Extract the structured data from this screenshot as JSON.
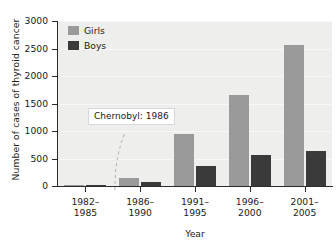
{
  "chart_data": {
    "type": "bar",
    "title": "",
    "xlabel": "Year",
    "ylabel": "Number of cases of thyroid cancer",
    "categories": [
      "1982–1985",
      "1986–1990",
      "1991–1995",
      "1996–2000",
      "2001–2005"
    ],
    "category_lines": [
      [
        "1982–",
        "1985"
      ],
      [
        "1986–",
        "1990"
      ],
      [
        "1991–",
        "1995"
      ],
      [
        "1996–",
        "2000"
      ],
      [
        "2001–",
        "2005"
      ]
    ],
    "series": [
      {
        "name": "Girls",
        "color": "#9a9a9a",
        "values": [
          10,
          150,
          950,
          1660,
          2570
        ]
      },
      {
        "name": "Boys",
        "color": "#3a3a3a",
        "values": [
          5,
          70,
          370,
          570,
          640
        ]
      }
    ],
    "ylim": [
      0,
      3000
    ],
    "yticks": [
      0,
      500,
      1000,
      1500,
      2000,
      2500,
      3000
    ],
    "ytick_labels": [
      "0",
      "500",
      "1000",
      "1500",
      "2000",
      "2500",
      "3000"
    ],
    "grid": true,
    "grid_axis": "y",
    "legend_position": "top-left",
    "annotations": [
      {
        "text": "Chernobyl: 1986",
        "kind": "callout-with-dashed-curve"
      }
    ],
    "plot_background": "#eeeeec",
    "axis_color": "#2b2b2b"
  },
  "legend": {
    "items": [
      {
        "label": "Girls"
      },
      {
        "label": "Boys"
      }
    ]
  },
  "annotation": {
    "chernobyl_label": "Chernobyl: 1986"
  }
}
